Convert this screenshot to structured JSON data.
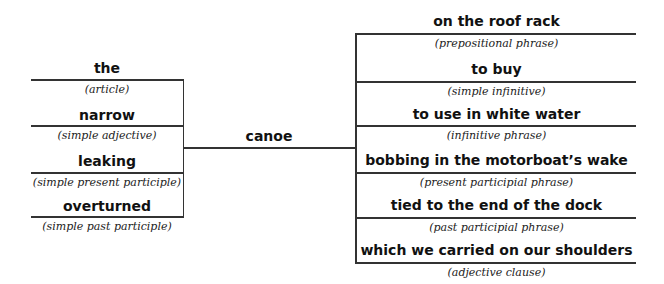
{
  "head": {
    "word": "canoe"
  },
  "left_modifiers": [
    {
      "word": "the",
      "label": "(article)"
    },
    {
      "word": "narrow",
      "label": "(simple adjective)"
    },
    {
      "word": "leaking",
      "label": "(simple present participle)"
    },
    {
      "word": "overturned",
      "label": "(simple past participle)"
    }
  ],
  "right_modifiers": [
    {
      "word": "on the roof rack",
      "label": "(prepositional phrase)"
    },
    {
      "word": "to buy",
      "label": "(simple infinitive)"
    },
    {
      "word": "to use in white water",
      "label": "(infinitive phrase)"
    },
    {
      "word": "bobbing in the motorboat’s wake",
      "label": "(present participial phrase)"
    },
    {
      "word": "tied to the end of the dock",
      "label": "(past participial phrase)"
    },
    {
      "word": "which we carried on our shoulders",
      "label": "(adjective clause)"
    }
  ]
}
